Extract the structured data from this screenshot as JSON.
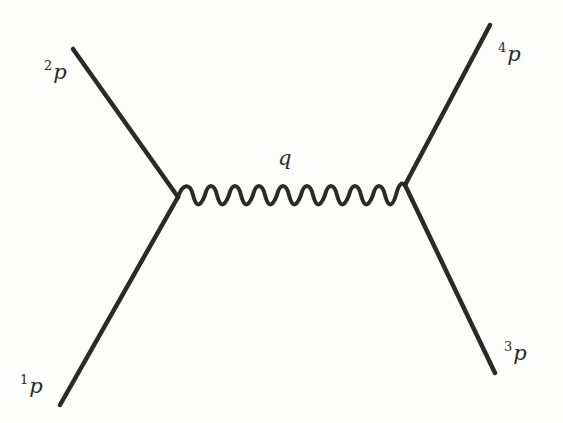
{
  "diagram": {
    "type": "feynman-diagram",
    "colors": {
      "line": "#2a2a2a",
      "background": "#fdfdfc",
      "bleed_through": "#e9e9e6"
    },
    "vertices": [
      {
        "id": "left",
        "x": 178,
        "y": 197
      },
      {
        "id": "right",
        "x": 405,
        "y": 185
      }
    ],
    "external_lines": [
      {
        "id": "p1",
        "label_super": "1",
        "label_main": "p",
        "from": [
          60,
          405
        ],
        "to": "left"
      },
      {
        "id": "p2",
        "label_super": "2",
        "label_main": "p",
        "from": [
          73,
          49
        ],
        "to": "left"
      },
      {
        "id": "p3",
        "label_super": "3",
        "label_main": "p",
        "from": [
          495,
          373
        ],
        "to": "right"
      },
      {
        "id": "p4",
        "label_super": "4",
        "label_main": "p",
        "from": [
          490,
          25
        ],
        "to": "right"
      }
    ],
    "propagator": {
      "style": "wavy",
      "label": "q",
      "oscillations": 10
    }
  },
  "labels": {
    "p1_super": "1",
    "p1_main": "p",
    "p2_super": "2",
    "p2_main": "p",
    "p3_super": "3",
    "p3_main": "p",
    "p4_super": "4",
    "p4_main": "p",
    "q": "q"
  }
}
